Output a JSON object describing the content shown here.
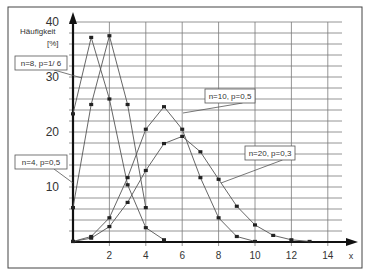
{
  "chart_data": {
    "type": "line",
    "title": "",
    "xlabel": "x",
    "ylabel": "Häufigkeit [%]",
    "ylabel_lines": [
      "Häufigkeit",
      "[%]"
    ],
    "xlim": [
      0,
      15
    ],
    "ylim": [
      0,
      40
    ],
    "x_ticks": [
      2,
      4,
      6,
      8,
      10,
      12,
      14
    ],
    "y_ticks": [
      10,
      20,
      30,
      40
    ],
    "grid": true,
    "grid_minor_y_step": 2,
    "series": [
      {
        "name": "n=8, p=1/ 6",
        "x": [
          0,
          1,
          2,
          3,
          4,
          5
        ],
        "values": [
          23.3,
          37.2,
          26.0,
          10.4,
          2.6,
          0.4
        ]
      },
      {
        "name": "n=4, p=0,5",
        "x": [
          0,
          1,
          2,
          3,
          4
        ],
        "values": [
          6.25,
          25.0,
          37.5,
          25.0,
          6.25
        ]
      },
      {
        "name": "n=10, p=0,5",
        "x": [
          0,
          1,
          2,
          3,
          4,
          5,
          6,
          7,
          8,
          9,
          10
        ],
        "values": [
          0.1,
          1.0,
          4.4,
          11.7,
          20.5,
          24.6,
          20.5,
          11.7,
          4.4,
          1.0,
          0.1
        ]
      },
      {
        "name": "n=20, p=0,3",
        "x": [
          0,
          1,
          2,
          3,
          4,
          5,
          6,
          7,
          8,
          9,
          10,
          11,
          12,
          13
        ],
        "values": [
          0.1,
          0.7,
          2.8,
          7.2,
          13.0,
          17.9,
          19.2,
          16.4,
          11.4,
          6.5,
          3.1,
          1.2,
          0.4,
          0.1
        ]
      }
    ],
    "annotations": [
      {
        "text": "n=8, p=1/ 6",
        "box": [
          15,
          56,
          52,
          14
        ],
        "target": [
          82,
          78
        ]
      },
      {
        "text": "n=4, p=0,5",
        "box": [
          15,
          155,
          52,
          14
        ],
        "target": [
          73,
          183
        ]
      },
      {
        "text": "n=10, p=0,5",
        "box": [
          205,
          89,
          50,
          14
        ],
        "target": [
          183,
          113
        ]
      },
      {
        "text": "n=20, p=0,3",
        "box": [
          245,
          146,
          50,
          14
        ],
        "target": [
          221,
          183
        ]
      }
    ]
  },
  "colors": {
    "line": "#555555",
    "marker": "#222222",
    "grid": "#7a7a7a",
    "axis": "#111111",
    "border": "#444444"
  }
}
